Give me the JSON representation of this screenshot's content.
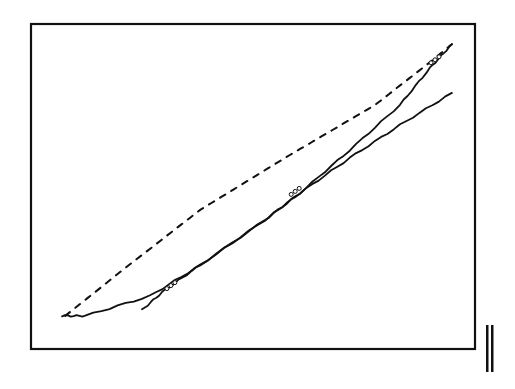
{
  "chart_data": {
    "type": "line",
    "title": "",
    "xlabel": "",
    "ylabel": "",
    "xlim": [
      0,
      100
    ],
    "ylim": [
      0,
      100
    ],
    "grid": false,
    "legend": "none",
    "series": [
      {
        "name": "dashed-curve",
        "style": "dashed",
        "x": [
          7.7,
          21.2,
          38.1,
          58.3,
          77.5,
          89.9,
          94.8
        ],
        "y": [
          10.2,
          24.9,
          42.8,
          59.7,
          75.1,
          88.3,
          93.8
        ]
      },
      {
        "name": "solid-upper-curve",
        "style": "solid",
        "x": [
          7.0,
          12.2,
          26.8,
          38.1,
          52.7,
          60.6,
          71.8,
          83.1,
          89.9,
          94.8
        ],
        "y": [
          10.2,
          10.2,
          16.3,
          25.8,
          39.7,
          48.0,
          61.2,
          75.1,
          86.5,
          93.8
        ]
      },
      {
        "name": "solid-lower-curve",
        "style": "solid",
        "x": [
          25.0,
          30.2,
          38.1,
          52.7,
          60.6,
          71.8,
          83.1,
          94.8
        ],
        "y": [
          12.0,
          18.2,
          25.8,
          39.7,
          48.0,
          58.8,
          68.9,
          78.8
        ]
      }
    ],
    "markers": [
      {
        "x": 31.5,
        "y": 19.5
      },
      {
        "x": 59.5,
        "y": 48.5
      },
      {
        "x": 91.0,
        "y": 89.0
      }
    ],
    "annotations": [
      "double-vertical-bar glyph at lower right"
    ]
  }
}
